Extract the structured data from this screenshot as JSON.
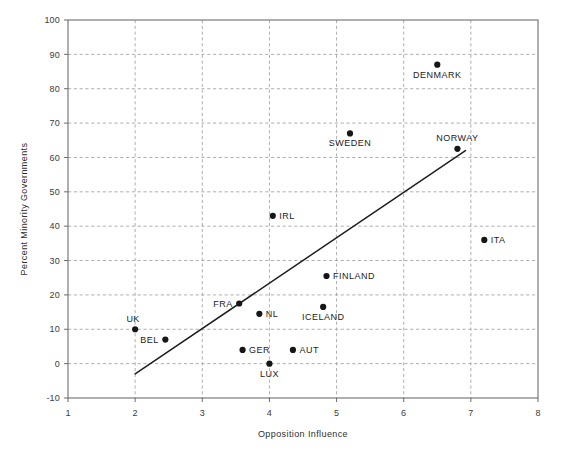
{
  "chart_data": {
    "type": "scatter",
    "title": "",
    "xlabel": "Opposition Influence",
    "ylabel": "Percent Minority Governments",
    "xlim": [
      1,
      8
    ],
    "ylim": [
      -10,
      100
    ],
    "xticks": [
      "1",
      "2",
      "3",
      "4",
      "5",
      "6",
      "7",
      "8"
    ],
    "xtick_values": [
      1,
      2,
      3,
      4,
      5,
      6,
      7,
      8
    ],
    "yticks": [
      "-10",
      "0",
      "10",
      "20",
      "30",
      "40",
      "50",
      "60",
      "70",
      "80",
      "90",
      "100"
    ],
    "ytick_values": [
      -10,
      0,
      10,
      20,
      30,
      40,
      50,
      60,
      70,
      80,
      90,
      100
    ],
    "grid": true,
    "grid_style": "dashed",
    "legend": "none",
    "points": [
      {
        "label": "DENMARK",
        "x": 6.5,
        "y": 87.0,
        "label_pos": "below"
      },
      {
        "label": "SWEDEN",
        "x": 5.2,
        "y": 67.0,
        "label_pos": "below"
      },
      {
        "label": "NORWAY",
        "x": 6.8,
        "y": 62.5,
        "label_pos": "above"
      },
      {
        "label": "IRL",
        "x": 4.05,
        "y": 43.0,
        "label_pos": "right"
      },
      {
        "label": "ITA",
        "x": 7.2,
        "y": 36.0,
        "label_pos": "right"
      },
      {
        "label": "FINLAND",
        "x": 4.85,
        "y": 25.5,
        "label_pos": "right"
      },
      {
        "label": "FRA",
        "x": 3.55,
        "y": 17.5,
        "label_pos": "left"
      },
      {
        "label": "ICELAND",
        "x": 4.8,
        "y": 16.5,
        "label_pos": "below"
      },
      {
        "label": "NL",
        "x": 3.85,
        "y": 14.5,
        "label_pos": "right"
      },
      {
        "label": "UK",
        "x": 2.0,
        "y": 10.0,
        "label_pos": "above-left"
      },
      {
        "label": "BEL",
        "x": 2.45,
        "y": 7.0,
        "label_pos": "left"
      },
      {
        "label": "GER",
        "x": 3.6,
        "y": 4.0,
        "label_pos": "right"
      },
      {
        "label": "AUT",
        "x": 4.35,
        "y": 4.0,
        "label_pos": "right"
      },
      {
        "label": "LUX",
        "x": 4.0,
        "y": 0.0,
        "label_pos": "below"
      }
    ],
    "fit_line": {
      "name": "regression-line",
      "x_start": 2.0,
      "y_start": -3.0,
      "x_end": 6.92,
      "y_end": 62.0
    },
    "colors": {
      "point": "#161616",
      "line": "#1f1f1f",
      "grid": "#9b9b9b",
      "frame": "#6d6d6d",
      "text": "#1c1c1c",
      "background": "#ffffff"
    }
  }
}
